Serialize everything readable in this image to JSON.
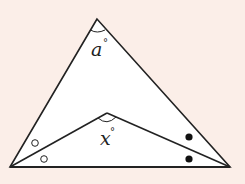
{
  "diagram": {
    "background_color": "#fbeee8",
    "fill_color": "#ffffff",
    "stroke_color": "#222222",
    "vertices": {
      "apex": {
        "x": 97,
        "y": 19
      },
      "bottom_left": {
        "x": 10,
        "y": 167
      },
      "bottom_right": {
        "x": 230,
        "y": 167
      },
      "inner": {
        "x": 107,
        "y": 113
      }
    },
    "labels": {
      "apex_angle": {
        "variable": "a",
        "unit": "°"
      },
      "inner_angle": {
        "variable": "x",
        "unit": "°"
      }
    },
    "markers": {
      "left_angle_bisected": {
        "symbol": "open-circle",
        "count": 2
      },
      "right_angle_bisected": {
        "symbol": "filled-dot",
        "count": 2
      }
    }
  }
}
